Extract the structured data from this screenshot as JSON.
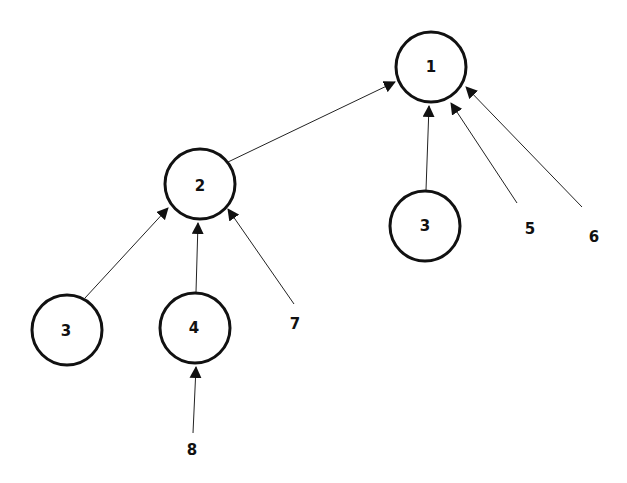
{
  "diagram": {
    "type": "tree",
    "nodes": [
      {
        "id": "n1",
        "label": "1",
        "x": 431,
        "y": 67,
        "circle": true
      },
      {
        "id": "n2",
        "label": "2",
        "x": 200,
        "y": 184,
        "circle": true
      },
      {
        "id": "n3r",
        "label": "3",
        "x": 425,
        "y": 226,
        "circle": true
      },
      {
        "id": "n3l",
        "label": "3",
        "x": 67,
        "y": 330,
        "circle": true
      },
      {
        "id": "n4",
        "label": "4",
        "x": 195,
        "y": 328,
        "circle": true
      },
      {
        "id": "t5",
        "label": "5",
        "x": 530,
        "y": 229,
        "circle": false
      },
      {
        "id": "t6",
        "label": "6",
        "x": 594,
        "y": 237,
        "circle": false
      },
      {
        "id": "t7",
        "label": "7",
        "x": 295,
        "y": 324,
        "circle": false
      },
      {
        "id": "t8",
        "label": "8",
        "x": 192,
        "y": 450,
        "circle": false
      }
    ],
    "edges": [
      {
        "from": "n2",
        "to": "n1"
      },
      {
        "from": "n3r",
        "to": "n1"
      },
      {
        "from": "t5",
        "to": "n1"
      },
      {
        "from": "t6",
        "to": "n1"
      },
      {
        "from": "n3l",
        "to": "n2"
      },
      {
        "from": "n4",
        "to": "n2"
      },
      {
        "from": "t7",
        "to": "n2"
      },
      {
        "from": "t8",
        "to": "n4"
      }
    ]
  }
}
